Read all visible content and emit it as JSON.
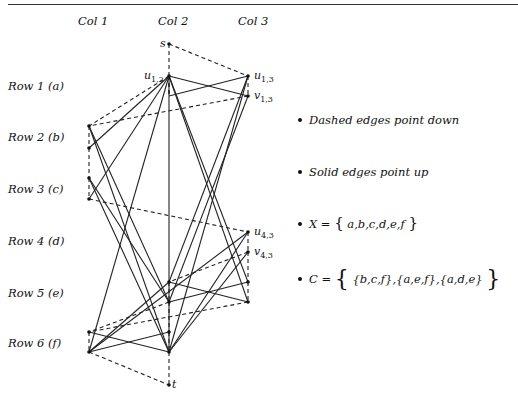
{
  "columns": [
    {
      "label": "Col 1",
      "x": 89
    },
    {
      "label": "Col 2",
      "x": 169
    },
    {
      "label": "Col 3",
      "x": 248
    }
  ],
  "rows": [
    {
      "label": "Row 1 (a)",
      "y": 86
    },
    {
      "label": "Row 2 (b)",
      "y": 137
    },
    {
      "label": "Row 3 (c)",
      "y": 189
    },
    {
      "label": "Row 4 (d)",
      "y": 241
    },
    {
      "label": "Row 5 (e)",
      "y": 293
    },
    {
      "label": "Row 6 (f)",
      "y": 343
    }
  ],
  "node_labels": {
    "s": "s",
    "t": "t",
    "u12_base": "u",
    "u12_sub": "1,2",
    "u13_base": "u",
    "u13_sub": "1,3",
    "v13_base": "v",
    "v13_sub": "1,3",
    "u43_base": "u",
    "u43_sub": "4,3",
    "v43_base": "v",
    "v43_sub": "4,3"
  },
  "legend": {
    "dashed": "Dashed edges point down",
    "solid": "Solid edges point up",
    "x_set_prefix": "X =",
    "x_set_open": "{",
    "x_set_items": "a,b,c,d,e,f",
    "x_set_close": "}",
    "c_set_prefix": "C =",
    "c_set_open": "{",
    "c_set_items": "{b,c,f},{a,e,f},{a,d,e}",
    "c_set_close": "}"
  },
  "graph": {
    "nodes": {
      "s": [
        169,
        44
      ],
      "u12": [
        169,
        76
      ],
      "u13": [
        248,
        76
      ],
      "v13": [
        248,
        96
      ],
      "b1": [
        89,
        126
      ],
      "b2": [
        89,
        148
      ],
      "c1": [
        89,
        178
      ],
      "c2": [
        89,
        199
      ],
      "u43": [
        248,
        232
      ],
      "v43": [
        248,
        252
      ],
      "e1": [
        169,
        282
      ],
      "e2": [
        169,
        302
      ],
      "e3": [
        248,
        282
      ],
      "e4": [
        248,
        302
      ],
      "f1": [
        89,
        332
      ],
      "f2": [
        89,
        352
      ],
      "f3": [
        169,
        332
      ],
      "f4": [
        169,
        352
      ],
      "t": [
        169,
        385
      ]
    },
    "dashed_edges": [
      [
        "s",
        "u12"
      ],
      [
        "s",
        "u13"
      ],
      [
        "u12",
        "v13_mid"
      ],
      [
        "u13",
        "v13"
      ],
      [
        "v13",
        "b1"
      ],
      [
        "u12",
        "b1"
      ],
      [
        "b1",
        "b2"
      ],
      [
        "b2",
        "c1"
      ],
      [
        "c1",
        "c2"
      ],
      [
        "c2",
        "u43"
      ],
      [
        "u43",
        "v43"
      ],
      [
        "v43",
        "e1"
      ],
      [
        "v43",
        "e3"
      ],
      [
        "e1",
        "e2"
      ],
      [
        "e3",
        "e4"
      ],
      [
        "e4",
        "f1"
      ],
      [
        "e2",
        "f1"
      ],
      [
        "f1",
        "f2"
      ],
      [
        "f3",
        "f4"
      ],
      [
        "e2",
        "f3"
      ],
      [
        "f2",
        "t"
      ],
      [
        "f4",
        "t"
      ],
      [
        "u12",
        "u12b"
      ]
    ],
    "solid_edges": [
      [
        "u12",
        "v13"
      ],
      [
        "u13",
        "u12v"
      ],
      [
        "u12",
        "b2"
      ],
      [
        "u12",
        "c2"
      ],
      [
        "u12",
        "f2"
      ],
      [
        "u12",
        "f4"
      ],
      [
        "u12",
        "e3"
      ],
      [
        "u12",
        "e4"
      ],
      [
        "u13",
        "e1"
      ],
      [
        "u13",
        "f4"
      ],
      [
        "v13",
        "e2"
      ],
      [
        "b1",
        "e2"
      ],
      [
        "b1",
        "f4"
      ],
      [
        "c1",
        "e2"
      ],
      [
        "c1",
        "f4"
      ],
      [
        "u43",
        "f2"
      ],
      [
        "u43",
        "f4"
      ],
      [
        "v43",
        "f4"
      ],
      [
        "e1",
        "e4"
      ],
      [
        "e3",
        "e2"
      ],
      [
        "f1",
        "f4"
      ],
      [
        "f2",
        "f3"
      ],
      [
        "f2",
        "e1"
      ]
    ]
  }
}
